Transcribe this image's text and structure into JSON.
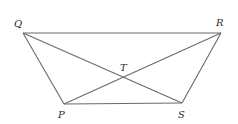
{
  "diagram": {
    "type": "geometry-figure",
    "colors": {
      "line": "#6a6a6a",
      "label": "#2a2a2a",
      "background": "#ffffff"
    },
    "points": {
      "Q": {
        "label": "Q",
        "x": 23,
        "y": 33,
        "lx": 14,
        "ly": 27
      },
      "R": {
        "label": "R",
        "x": 221,
        "y": 33,
        "lx": 216,
        "ly": 26
      },
      "P": {
        "label": "P",
        "x": 64,
        "y": 104,
        "lx": 58,
        "ly": 118
      },
      "S": {
        "label": "S",
        "x": 182,
        "y": 103,
        "lx": 178,
        "ly": 118
      },
      "T": {
        "label": "T",
        "x": 123,
        "y": 78,
        "lx": 120,
        "ly": 71
      }
    },
    "segments": [
      [
        "Q",
        "R"
      ],
      [
        "Q",
        "P"
      ],
      [
        "R",
        "S"
      ],
      [
        "P",
        "S"
      ],
      [
        "Q",
        "S"
      ],
      [
        "R",
        "P"
      ]
    ]
  }
}
